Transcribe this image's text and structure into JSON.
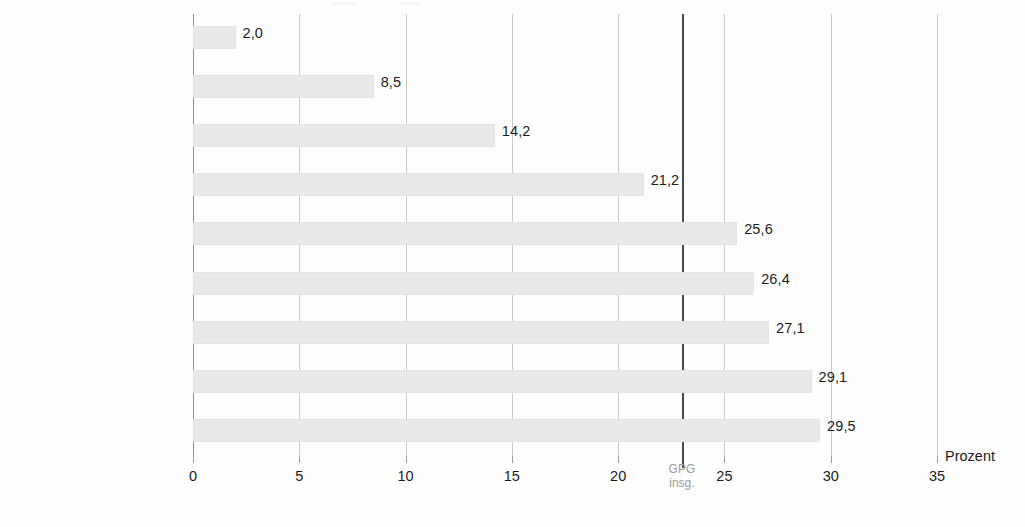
{
  "chart_data": {
    "type": "bar",
    "orientation": "horizontal",
    "title": "",
    "subtitle": "",
    "xlabel": "Prozent",
    "ylabel": "",
    "xlim": [
      0,
      35
    ],
    "xticks": [
      "0",
      "5",
      "10",
      "15",
      "20",
      "25",
      "30",
      "35"
    ],
    "xtick_values": [
      0,
      5,
      10,
      15,
      20,
      25,
      30,
      35
    ],
    "grid": "vertical",
    "legend": "none",
    "categories": [
      "24 Jahre und jünger",
      "25 bis 29 Jahre",
      "30 bis 34 Jahre",
      "35 bis 39 Jahre",
      "40 bis 44 Jahre",
      "45 bis 49 Jahre",
      "50 bis 54 Jahre",
      "55 bis 59 Jahre",
      "60 Jahre und älter"
    ],
    "values": [
      2.0,
      8.5,
      14.2,
      21.2,
      25.6,
      26.4,
      27.1,
      29.1,
      29.5
    ],
    "value_labels": [
      "2,0",
      "8,5",
      "14,2",
      "21,2",
      "25,6",
      "26,4",
      "27,1",
      "29,1",
      "29,5"
    ],
    "annotations": [
      {
        "name": "gpg-insgesamt-referenzlinie",
        "value": 23.0,
        "label_line1": "GPG",
        "label_line2": "insg.",
        "color": "#4a4a4a"
      }
    ],
    "colors": {
      "bar": "#e9e9e9",
      "bar_edge": "#e4e4e4",
      "gridline": "#c8c8c8",
      "axis": "#8e8e8e",
      "text": "#1b1b1b",
      "annotation_text": "#9b9b9b",
      "background": "#fefefe"
    }
  }
}
